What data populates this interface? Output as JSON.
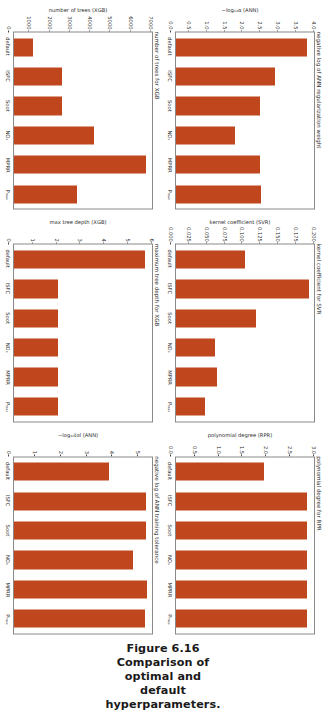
{
  "figure": {
    "caption": "Figure 6.16 Comparison of optimal and default hyperparameters.",
    "bar_color": "#c0461d",
    "axis_color": "#8a8a8a",
    "categories": [
      "default",
      "ISFC",
      "Soot",
      "NOₓ",
      "MPRR",
      "Pₘₐₓ"
    ]
  },
  "chart_data": [
    {
      "type": "bar",
      "title": "negative log of ANN regularization weight",
      "xlabel": "",
      "ylabel": "−log₁₀α (ANN)",
      "categories": [
        "default",
        "ISFC",
        "Soot",
        "NOₓ",
        "MPRR",
        "Pₘₐₓ"
      ],
      "values": [
        4.0,
        3.0,
        2.55,
        1.8,
        2.55,
        2.6
      ],
      "ylim": [
        0.0,
        4.2
      ],
      "yticks": [
        "4.0",
        "3.5",
        "3.0",
        "2.5",
        "2.0",
        "1.5",
        "1.0",
        "0.5",
        "0.0"
      ],
      "ytick_values": [
        4.0,
        3.5,
        3.0,
        2.5,
        2.0,
        1.5,
        1.0,
        0.5,
        0.0
      ],
      "grid": false,
      "legend": "none"
    },
    {
      "type": "bar",
      "title": "kernel coefficient for SVR",
      "xlabel": "",
      "ylabel": "kernel coefficient (SVR)",
      "categories": [
        "default",
        "ISFC",
        "Soot",
        "NOₓ",
        "MPRR",
        "Pₘₐₓ"
      ],
      "values": [
        0.105,
        0.202,
        0.122,
        0.059,
        0.063,
        0.044
      ],
      "ylim": [
        0.0,
        0.21
      ],
      "yticks": [
        "0.200",
        "0.175",
        "0.150",
        "0.125",
        "0.100",
        "0.075",
        "0.050",
        "0.025",
        "0.000"
      ],
      "ytick_values": [
        0.2,
        0.175,
        0.15,
        0.125,
        0.1,
        0.075,
        0.05,
        0.025,
        0.0
      ],
      "grid": false,
      "legend": "none"
    },
    {
      "type": "bar",
      "title": "polynomial degree for RPR",
      "xlabel": "",
      "ylabel": "polynomial degree (RPR)",
      "categories": [
        "default",
        "ISFC",
        "Soot",
        "NOₓ",
        "MPRR",
        "Pₘₐₓ"
      ],
      "values": [
        2.0,
        3.0,
        3.0,
        3.0,
        3.0,
        3.0
      ],
      "ylim": [
        0.0,
        3.15
      ],
      "yticks": [
        "3.0",
        "2.5",
        "2.0",
        "1.5",
        "1.0",
        "0.5",
        "0.0"
      ],
      "ytick_values": [
        3.0,
        2.5,
        2.0,
        1.5,
        1.0,
        0.5,
        0.0
      ],
      "grid": false,
      "legend": "none"
    },
    {
      "type": "bar",
      "title": "number of trees for XGB",
      "xlabel": "",
      "ylabel": "number of trees (XGB)",
      "categories": [
        "default",
        "ISFC",
        "Soot",
        "NOₓ",
        "MPRR",
        "Pₘₐₓ"
      ],
      "values": [
        1000,
        2600,
        2600,
        4300,
        7100,
        3400
      ],
      "ylim": [
        0,
        7400
      ],
      "yticks": [
        "7000",
        "6000",
        "5000",
        "4000",
        "3000",
        "2000",
        "1000",
        "0"
      ],
      "ytick_values": [
        7000,
        6000,
        5000,
        4000,
        3000,
        2000,
        1000,
        0
      ],
      "grid": false,
      "legend": "none"
    },
    {
      "type": "bar",
      "title": "maximum tree depth for XGB",
      "xlabel": "",
      "ylabel": "max tree depth (XGB)",
      "categories": [
        "default",
        "ISFC",
        "Soot",
        "NOₓ",
        "MPRR",
        "Pₘₐₓ"
      ],
      "values": [
        6,
        2,
        2,
        2,
        2,
        2
      ],
      "ylim": [
        0,
        6.3
      ],
      "yticks": [
        "6",
        "5",
        "4",
        "3",
        "2",
        "1",
        "0"
      ],
      "ytick_values": [
        6,
        5,
        4,
        3,
        2,
        1,
        0
      ],
      "grid": false,
      "legend": "none"
    },
    {
      "type": "bar",
      "title": "negative log of ANN training tolerance",
      "xlabel": "",
      "ylabel": "−log₁₀tol (ANN)",
      "categories": [
        "default",
        "ISFC",
        "Soot",
        "NOₓ",
        "MPRR",
        "Pₘₐₓ"
      ],
      "values": [
        4.0,
        5.55,
        5.55,
        5.0,
        5.6,
        5.5
      ],
      "ylim": [
        0,
        5.8
      ],
      "yticks": [
        "5",
        "4",
        "3",
        "2",
        "1",
        "0"
      ],
      "ytick_values": [
        5,
        4,
        3,
        2,
        1,
        0
      ],
      "grid": false,
      "legend": "none"
    }
  ]
}
